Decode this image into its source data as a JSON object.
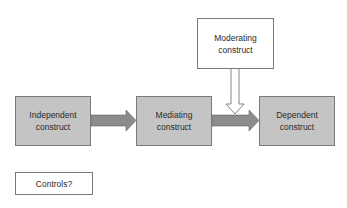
{
  "diagram": {
    "nodes": {
      "independent": {
        "line1": "Independent",
        "line2": "construct"
      },
      "mediating": {
        "line1": "Mediating",
        "line2": "construct"
      },
      "dependent": {
        "line1": "Dependent",
        "line2": "construct"
      },
      "moderating": {
        "line1": "Moderating",
        "line2": "construct"
      },
      "controls": {
        "label": "Controls?"
      }
    },
    "edges": [
      {
        "from": "independent",
        "to": "mediating",
        "style": "filled-gray"
      },
      {
        "from": "mediating",
        "to": "dependent",
        "style": "filled-gray"
      },
      {
        "from": "moderating",
        "to": "mediating-dependent-edge",
        "style": "hollow"
      }
    ],
    "colors": {
      "shaded_fill": "#c4c4c4",
      "arrow_fill": "#8c8c8c",
      "border": "#7a7a7a"
    }
  }
}
